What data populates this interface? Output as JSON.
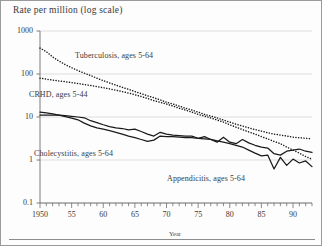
{
  "figure": {
    "axis_title": "Rate per million (log scale)",
    "background_color": "#fdfdfd",
    "frame_color": "#9a9a9a",
    "line_color": "#1a1a1a"
  },
  "chart_data": {
    "type": "line",
    "title": "Rate per million (log scale)",
    "xlabel": "Year",
    "ylabel": "Rate per million (log scale)",
    "yscale": "log",
    "ylim": [
      0.1,
      1000
    ],
    "xlim": [
      1950,
      1993
    ],
    "grid": true,
    "legend": "inline-annotations",
    "ytick_values": [
      1000,
      100,
      10,
      1,
      0.1
    ],
    "ytick_labels": [
      "1000",
      "100",
      "10",
      "1",
      "0.1"
    ],
    "xtick_values": [
      1950,
      1955,
      1960,
      1965,
      1970,
      1975,
      1980,
      1985,
      1990
    ],
    "xtick_labels": [
      "1950",
      "55",
      "60",
      "65",
      "70",
      "75",
      "80",
      "85",
      "90"
    ],
    "xtick_minor_interval": 1,
    "series": [
      {
        "name": "Tuberculosis, ages 5-64",
        "style": "dotted",
        "label_x": 1963,
        "label_y": 190,
        "x": [
          1950,
          1951,
          1952,
          1953,
          1954,
          1955,
          1956,
          1957,
          1958,
          1959,
          1960,
          1961,
          1962,
          1963,
          1964,
          1965,
          1966,
          1967,
          1968,
          1969,
          1970,
          1971,
          1972,
          1973,
          1974,
          1975,
          1976,
          1977,
          1978,
          1979,
          1980,
          1981,
          1982,
          1983,
          1984,
          1985,
          1986,
          1987,
          1988,
          1989,
          1990,
          1991,
          1992,
          1993
        ],
        "values": [
          400,
          330,
          250,
          200,
          165,
          140,
          120,
          105,
          92,
          80,
          70,
          62,
          55,
          49,
          44,
          39,
          35,
          31,
          28,
          25,
          22,
          20,
          18,
          16,
          14.5,
          13,
          11.5,
          10.5,
          9.5,
          8.5,
          7.6,
          6.8,
          6.2,
          5.6,
          5.1,
          4.7,
          4.3,
          4.0,
          3.8,
          3.6,
          3.4,
          3.3,
          3.2,
          3.1
        ]
      },
      {
        "name": "CRHD, ages 5-44",
        "style": "dotted",
        "label_x": 1951,
        "label_y": 30,
        "x": [
          1950,
          1951,
          1952,
          1953,
          1954,
          1955,
          1956,
          1957,
          1958,
          1959,
          1960,
          1961,
          1962,
          1963,
          1964,
          1965,
          1966,
          1967,
          1968,
          1969,
          1970,
          1971,
          1972,
          1973,
          1974,
          1975,
          1976,
          1977,
          1978,
          1979,
          1980,
          1981,
          1982,
          1983,
          1984,
          1985,
          1986,
          1987,
          1988,
          1989,
          1990,
          1991,
          1992,
          1993
        ],
        "values": [
          80,
          76,
          72,
          69,
          66,
          63,
          60,
          57,
          54,
          51,
          48,
          45,
          42,
          39,
          36,
          33,
          30,
          27,
          24,
          22,
          20,
          18,
          16,
          14.5,
          13,
          11.5,
          10.5,
          9.5,
          8.5,
          7.6,
          6.6,
          5.8,
          5.1,
          4.5,
          4.0,
          3.5,
          3.1,
          2.7,
          2.4,
          2.0,
          1.7,
          1.45,
          1.2,
          1.05
        ]
      },
      {
        "name": "Cholecystitis, ages 5-64",
        "style": "solid",
        "label_x": 1952,
        "label_y": 2.0,
        "x": [
          1950,
          1951,
          1952,
          1953,
          1954,
          1955,
          1956,
          1957,
          1958,
          1959,
          1960,
          1961,
          1962,
          1963,
          1964,
          1965,
          1966,
          1967,
          1968,
          1969,
          1970,
          1971,
          1972,
          1973,
          1974,
          1975,
          1976,
          1977,
          1978,
          1979,
          1980,
          1981,
          1982,
          1983,
          1984,
          1985,
          1986,
          1987,
          1988,
          1989,
          1990,
          1991,
          1992,
          1993
        ],
        "values": [
          11.0,
          11.0,
          11.0,
          11.0,
          10.8,
          10.4,
          10.0,
          9.6,
          8.2,
          7.4,
          6.6,
          6.0,
          5.6,
          5.4,
          5.0,
          5.2,
          4.6,
          4.0,
          3.6,
          4.4,
          4.0,
          3.8,
          3.7,
          3.6,
          3.6,
          3.2,
          3.5,
          3.0,
          2.6,
          3.4,
          2.6,
          2.4,
          3.0,
          2.5,
          2.2,
          2.0,
          1.9,
          1.4,
          1.3,
          1.6,
          1.7,
          1.8,
          1.6,
          1.5
        ]
      },
      {
        "name": "Appendicitis, ages 5-64",
        "style": "solid",
        "label_x": 1977,
        "label_y": 0.55,
        "x": [
          1950,
          1951,
          1952,
          1953,
          1954,
          1955,
          1956,
          1957,
          1958,
          1959,
          1960,
          1961,
          1962,
          1963,
          1964,
          1965,
          1966,
          1967,
          1968,
          1969,
          1970,
          1971,
          1972,
          1973,
          1974,
          1975,
          1976,
          1977,
          1978,
          1979,
          1980,
          1981,
          1982,
          1983,
          1984,
          1985,
          1986,
          1987,
          1988,
          1989,
          1990,
          1991,
          1992,
          1993
        ],
        "values": [
          13.0,
          12.4,
          11.8,
          11.0,
          10.2,
          9.4,
          8.6,
          7.2,
          6.2,
          5.6,
          5.2,
          4.8,
          4.4,
          4.0,
          3.6,
          3.3,
          3.0,
          2.7,
          2.9,
          3.6,
          3.5,
          3.5,
          3.4,
          3.3,
          3.3,
          3.2,
          3.1,
          3.0,
          2.8,
          2.6,
          2.4,
          2.2,
          2.0,
          1.7,
          1.45,
          1.25,
          1.3,
          0.62,
          1.15,
          0.75,
          1.05,
          0.85,
          0.95,
          0.7
        ]
      }
    ]
  },
  "xaxis": {
    "name": "Year"
  }
}
